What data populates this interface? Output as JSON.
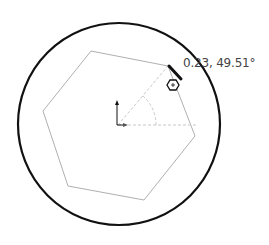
{
  "sketch": {
    "dimension_label": "0.23, 49.51°",
    "colors": {
      "circle": "#111111",
      "polygon": "#b0b0b0",
      "construction": "#c8c8c8",
      "cursor": "#111111",
      "text": "#444444"
    }
  }
}
